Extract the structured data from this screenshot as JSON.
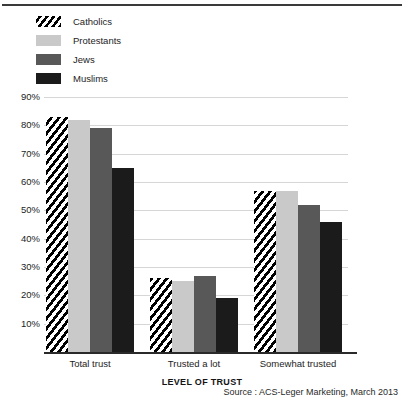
{
  "chart_data": {
    "type": "bar",
    "title": "TRUST TOWARDS RELIGIOUS GROUPS",
    "xlabel": "LEVEL OF TRUST",
    "ylabel": "",
    "categories": [
      "Total trust",
      "Trusted a lot",
      "Somewhat trusted"
    ],
    "series": [
      {
        "name": "Catholics",
        "values": [
          83,
          26,
          57
        ],
        "color": "#000000",
        "fill": "diagonal-hatch"
      },
      {
        "name": "Protestants",
        "values": [
          82,
          25,
          57
        ],
        "color": "#c9c9c9",
        "fill": "solid"
      },
      {
        "name": "Jews",
        "values": [
          79,
          27,
          52
        ],
        "color": "#585858",
        "fill": "solid"
      },
      {
        "name": "Muslims",
        "values": [
          65,
          19,
          46
        ],
        "color": "#1b1b1b",
        "fill": "solid"
      }
    ],
    "ylim": [
      0,
      90
    ],
    "yticks": [
      "90%",
      "80%",
      "70%",
      "60%",
      "50%",
      "40%",
      "30%",
      "20%",
      "10%"
    ],
    "ytick_values": [
      90,
      80,
      70,
      60,
      50,
      40,
      30,
      20,
      10
    ],
    "grid": true,
    "legend_position": "top-left",
    "value_suffix": "%"
  },
  "source": "Source : ACS-Leger Marketing, March 2013"
}
